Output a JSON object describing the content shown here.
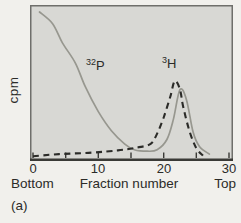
{
  "figure_label": "(a)",
  "colors": {
    "page_background": "#f1f0ec",
    "plot_background": "#d8d8d4",
    "plot_border": "#6f6f6b",
    "axis_line": "#3a3a36",
    "text": "#2b2b28",
    "p32_curve": "#97978f",
    "h3_curve": "#2b2b28"
  },
  "chart_data": {
    "type": "line",
    "title": "",
    "xlabel": "Fraction number",
    "ylabel": "cpm",
    "x_left_label": "Bottom",
    "x_right_label": "Top",
    "xlim": [
      0,
      30
    ],
    "ylim": [
      0,
      105
    ],
    "x_tick_labels": [
      "0",
      "10",
      "20",
      "30"
    ],
    "x_tick_values": [
      0,
      5,
      10,
      15,
      20,
      25,
      30
    ],
    "grid": false,
    "legend_position": "inline-annotations",
    "y_units": "relative cpm (unlabeled axis, arbitrary units)",
    "series": [
      {
        "name": "32P",
        "label_sup": "32",
        "label_base": "P",
        "style": "solid",
        "color": "#97978f",
        "width": 1.7,
        "x": [
          1,
          3,
          4.5,
          6.5,
          8,
          10,
          12,
          14,
          15.5,
          17.5,
          19,
          20.5,
          21.5,
          22.5,
          23.5,
          24.5,
          25.5,
          27
        ],
        "y": [
          100,
          92,
          79,
          65,
          49,
          32,
          19,
          10,
          6,
          5,
          6,
          13,
          27,
          47,
          40,
          18,
          8,
          3
        ]
      },
      {
        "name": "3H",
        "label_sup": "3",
        "label_base": "H",
        "style": "dashed",
        "color": "#2b2b28",
        "width": 2.1,
        "x": [
          0,
          4,
          9,
          13,
          16,
          18,
          19,
          20,
          21,
          21.7,
          22.5,
          23,
          24,
          25,
          26
        ],
        "y": [
          1.5,
          3,
          4,
          5.5,
          7.5,
          10,
          17,
          28,
          42,
          53,
          47,
          35,
          18,
          7,
          2
        ]
      }
    ]
  }
}
